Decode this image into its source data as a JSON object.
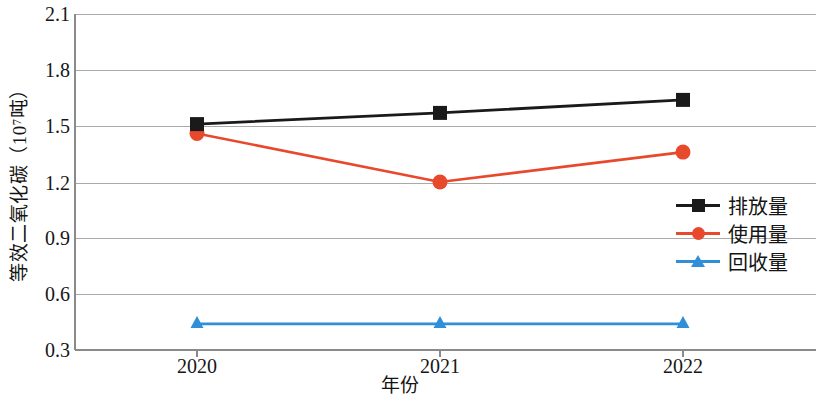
{
  "chart_data": {
    "type": "line",
    "title": "",
    "xlabel": "年份",
    "ylabel": "等效二氧化碳（10⁷吨）",
    "categories": [
      "2020",
      "2021",
      "2022"
    ],
    "ylim": [
      0.3,
      2.1
    ],
    "ytick_labels": [
      "2.1",
      "1.8",
      "1.5",
      "1.2",
      "0.9",
      "0.6",
      "0.3"
    ],
    "ytick_values": [
      2.1,
      1.8,
      1.5,
      1.2,
      0.9,
      0.6,
      0.3
    ],
    "grid": true,
    "legend_position": "center-right",
    "series": [
      {
        "name": "排放量",
        "color": "#1a1a1a",
        "marker": "square",
        "values": [
          1.51,
          1.57,
          1.64
        ]
      },
      {
        "name": "使用量",
        "color": "#e8492c",
        "marker": "circle",
        "values": [
          1.46,
          1.2,
          1.36
        ]
      },
      {
        "name": "回收量",
        "color": "#2f8fd8",
        "marker": "triangle",
        "values": [
          0.44,
          0.44,
          0.44
        ]
      }
    ]
  },
  "axis": {
    "y_title": "等效二氧化碳（10⁷吨）",
    "x_title": "年份",
    "ticks_y": [
      "2.1",
      "1.8",
      "1.5",
      "1.2",
      "0.9",
      "0.6",
      "0.3"
    ],
    "ticks_x": [
      "2020",
      "2021",
      "2022"
    ]
  },
  "legend": {
    "items": [
      {
        "label": "排放量"
      },
      {
        "label": "使用量"
      },
      {
        "label": "回收量"
      }
    ]
  },
  "colors": {
    "emission": "#1a1a1a",
    "usage": "#e8492c",
    "recovery": "#2f8fd8",
    "grid": "#aaaaaa",
    "axis": "#8a8a8a",
    "background": "#ffffff"
  }
}
